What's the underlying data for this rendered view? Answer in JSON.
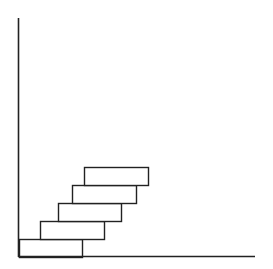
{
  "diagram": {
    "type": "staircase-gantt",
    "axes": {
      "y_axis": {
        "x": 18.5,
        "y1": 18,
        "y2": 257
      },
      "x_axis": {
        "y": 256.5,
        "x1": 18,
        "x2": 255
      },
      "stroke": "#222222"
    },
    "box_style": {
      "fill": "#ffffff",
      "stroke": "#222222"
    },
    "boxes": [
      {
        "x": 19,
        "y": 239,
        "w": 63,
        "h": 18
      },
      {
        "x": 40,
        "y": 221,
        "w": 64,
        "h": 18
      },
      {
        "x": 58,
        "y": 203,
        "w": 63,
        "h": 18
      },
      {
        "x": 72,
        "y": 185,
        "w": 64,
        "h": 18
      },
      {
        "x": 84,
        "y": 167,
        "w": 64,
        "h": 18
      }
    ]
  },
  "chart_data": {
    "type": "bar",
    "orientation": "horizontal-stacked-staircase",
    "title": "",
    "xlabel": "",
    "ylabel": "",
    "grid": false,
    "bars": [
      {
        "row": 1,
        "start": 0,
        "end": 63
      },
      {
        "row": 2,
        "start": 21,
        "end": 85
      },
      {
        "row": 3,
        "start": 39,
        "end": 102
      },
      {
        "row": 4,
        "start": 53,
        "end": 117
      },
      {
        "row": 5,
        "start": 65,
        "end": 129
      }
    ]
  }
}
